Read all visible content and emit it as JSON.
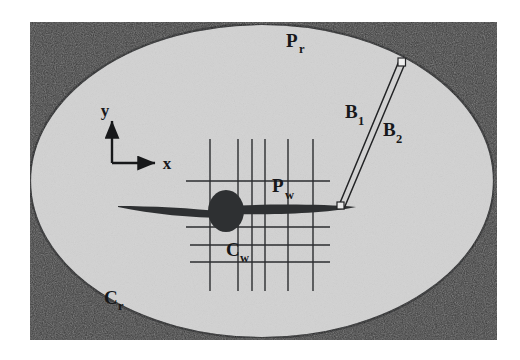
{
  "figure": {
    "background_color": "#ffffff",
    "panel_color": "#3a3a3a",
    "domain_fill_color": "#d2d2d2",
    "ink_color": "#17181a"
  },
  "panel": {
    "x": 30,
    "y": 22,
    "width": 467,
    "height": 318
  },
  "far_field": {
    "shape": "ellipse",
    "cx": 262,
    "cy": 181,
    "rx": 232,
    "ry": 157,
    "labels": {
      "p_r": {
        "base": "P",
        "sub": "r",
        "x": 286,
        "y": 47
      },
      "c_r": {
        "base": "C",
        "sub": "r",
        "x": 104,
        "y": 304
      }
    }
  },
  "axes": {
    "origin_x": 112,
    "origin_y": 163,
    "x_length": 47,
    "y_length": 44,
    "x_label": "x",
    "y_label": "y"
  },
  "grid": {
    "name": "structured-near-field-grid",
    "vertical_lines_x": [
      210,
      238,
      252,
      265,
      288,
      313
    ],
    "horizontal_lines_y": [
      181,
      227,
      245,
      262
    ],
    "v_top": 139,
    "v_bottom": 291,
    "h_left": 186,
    "h_right": 330,
    "line_color": "#2b2d2f",
    "line_width": 1.4,
    "labels": {
      "p_w": {
        "base": "P",
        "sub": "w",
        "x": 272,
        "y": 192
      },
      "c_w": {
        "base": "C",
        "sub": "w",
        "x": 226,
        "y": 256
      }
    }
  },
  "wing": {
    "name": "swept-wing-airfoil",
    "left_tip_x": 118,
    "right_tip_x": 356,
    "chord_y": 210,
    "fuselage": {
      "cx": 226,
      "cy": 211,
      "rx": 18,
      "ry": 21
    },
    "color": "#2e3032"
  },
  "boom": {
    "name": "boom-strut",
    "root_x": 341,
    "root_y": 206,
    "tip_x": 402,
    "tip_y": 62,
    "marker_size": 7,
    "labels": {
      "b_1": {
        "base": "B",
        "sub": "1",
        "x": 345,
        "y": 118
      },
      "b_2": {
        "base": "B",
        "sub": "2",
        "x": 383,
        "y": 136
      }
    }
  }
}
